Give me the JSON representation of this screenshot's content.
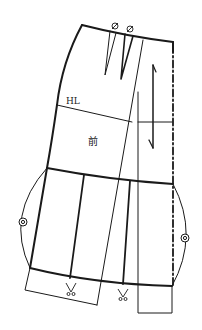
{
  "diagram": {
    "type": "garment-pattern",
    "labels": {
      "hip_line": "HL",
      "front": "前"
    },
    "symbols": {
      "dart_marks": [
        "ø",
        "ø"
      ],
      "notch_marks": [
        "◎",
        "◎"
      ],
      "scissor_marks": [
        "✂",
        "✂"
      ]
    },
    "colors": {
      "line": "#1a1a1a",
      "background": "#ffffff"
    }
  }
}
